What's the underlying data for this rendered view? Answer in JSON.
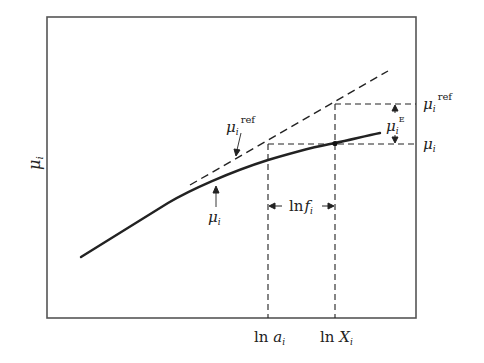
{
  "figure": {
    "y_axis_label": {
      "symbol": "μ",
      "subscript": "i"
    },
    "x_tick_labels": [
      {
        "prefix": "ln ",
        "symbol": "a",
        "subscript": "i"
      },
      {
        "prefix": "ln ",
        "symbol": "X",
        "subscript": "i"
      }
    ],
    "annotations": {
      "mu_ref_left": {
        "symbol": "μ",
        "subscript": "i",
        "superscript": "ref"
      },
      "mu_left": {
        "symbol": "μ",
        "subscript": "i"
      },
      "ln_f": {
        "prefix": "ln",
        "symbol": "f",
        "subscript": "i"
      },
      "mu_ref_right": {
        "symbol": "μ",
        "subscript": "i",
        "superscript": "ref"
      },
      "mu_excess": {
        "symbol": "μ",
        "subscript": "i",
        "superscript": "E"
      },
      "mu_right": {
        "symbol": "μ",
        "subscript": "i"
      }
    },
    "curves": [
      {
        "name": "actual chemical potential",
        "style": "solid"
      },
      {
        "name": "reference chemical potential",
        "style": "dashed"
      }
    ],
    "colors": {
      "ink": "#222222",
      "frame": "#555555",
      "background": "#ffffff"
    }
  }
}
